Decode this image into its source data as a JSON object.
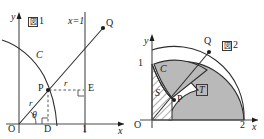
{
  "figure1": {
    "tag": "図1",
    "tag_mark": "図",
    "tag_number": "1",
    "axis_x_label": "x",
    "axis_y_label": "y",
    "origin_label": "O",
    "line_label": "x=1",
    "tick_x_1": "1",
    "points": {
      "P": "P",
      "Q": "Q",
      "D": "D",
      "E": "E"
    },
    "curve_label": "C",
    "radius_label_left": "r",
    "radius_label_right": "r",
    "angle_label": "θ"
  },
  "figure2": {
    "tag": "図2",
    "tag_mark": "図",
    "tag_number": "2",
    "axis_x_label": "x",
    "axis_y_label": "y",
    "origin_label": "O",
    "tick_y_1": "1",
    "tick_x_2": "2",
    "curve_label": "C",
    "points": {
      "P": "P",
      "Q": "Q"
    },
    "regions": {
      "S": "S",
      "T": "T"
    }
  },
  "colors": {
    "region_fill": "#b9b9b9",
    "stroke": "#2e2e2e",
    "axis": "#4a4a4a",
    "background": "#ffffff",
    "text": "#1c1c1c"
  }
}
